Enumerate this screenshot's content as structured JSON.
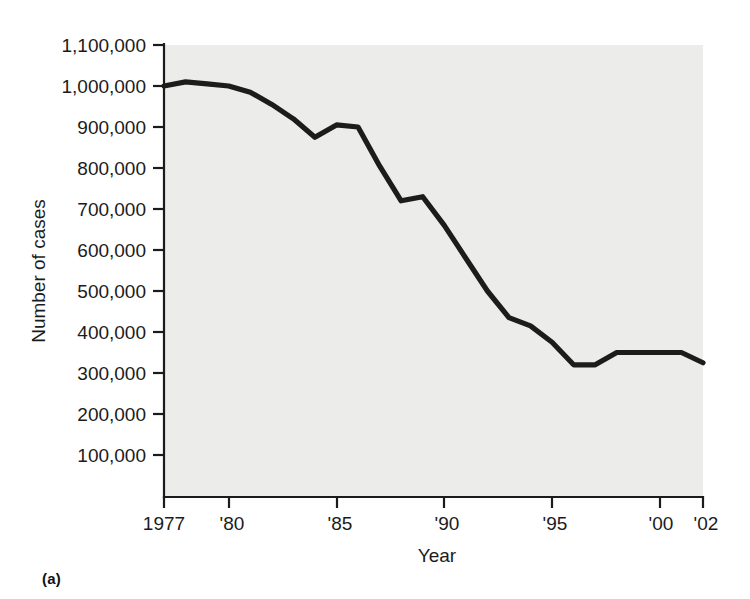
{
  "figure": {
    "panel_label": "(a)",
    "background_color": "#ffffff",
    "plot_background_color": "#ececeb",
    "line_color": "#1c1c1c"
  },
  "chart_data": {
    "type": "line",
    "title": "",
    "xlabel": "Year",
    "ylabel": "Number of cases",
    "xlim": [
      1977,
      2002
    ],
    "ylim": [
      0,
      1100000
    ],
    "grid": false,
    "legend": null,
    "x_tick_labels": [
      "1977",
      "'80",
      "'85",
      "'90",
      "'95",
      "'00",
      "'02"
    ],
    "x_tick_values": [
      1977,
      1980,
      1985,
      1990,
      1995,
      2000,
      2002
    ],
    "y_tick_labels": [
      "1,100,000",
      "1,000,000",
      "900,000",
      "800,000",
      "700,000",
      "600,000",
      "500,000",
      "400,000",
      "300,000",
      "200,000",
      "100,000"
    ],
    "y_tick_values": [
      1100000,
      1000000,
      900000,
      800000,
      700000,
      600000,
      500000,
      400000,
      300000,
      200000,
      100000
    ],
    "x": [
      1977,
      1978,
      1979,
      1980,
      1981,
      1982,
      1983,
      1984,
      1985,
      1986,
      1987,
      1988,
      1989,
      1990,
      1991,
      1992,
      1993,
      1994,
      1995,
      1996,
      1997,
      1998,
      1999,
      2000,
      2001,
      2002
    ],
    "values": [
      1000000,
      1010000,
      1005000,
      1000000,
      985000,
      955000,
      920000,
      875000,
      905000,
      900000,
      805000,
      720000,
      730000,
      660000,
      580000,
      500000,
      435000,
      415000,
      375000,
      320000,
      320000,
      350000,
      350000,
      350000,
      350000,
      325000
    ],
    "series": [
      {
        "name": "Number of cases",
        "values": [
          1000000,
          1010000,
          1005000,
          1000000,
          985000,
          955000,
          920000,
          875000,
          905000,
          900000,
          805000,
          720000,
          730000,
          660000,
          580000,
          500000,
          435000,
          415000,
          375000,
          320000,
          320000,
          350000,
          350000,
          350000,
          350000,
          325000
        ]
      }
    ]
  }
}
